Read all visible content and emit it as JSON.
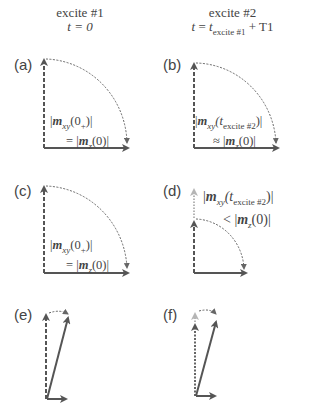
{
  "columns": [
    {
      "title": "excite #1",
      "subtitle_prefix": "t = 0"
    },
    {
      "title": "excite #2",
      "subtitle_t": "t",
      "subtitle_eq": " = ",
      "subtitle_tsub": "t",
      "subtitle_sub": "excite #1",
      "subtitle_suffix": " + T1"
    }
  ],
  "panels": [
    {
      "label": "(a)",
      "line1_open": "|",
      "line1_m": "m",
      "line1_sub": "xy",
      "line1_arg": "(0",
      "line1_argsub": "+",
      "line1_close": ")|",
      "line2_rel": "= |",
      "line2_m": "m",
      "line2_sub": "z",
      "line2_close": "(0)|"
    },
    {
      "label": "(b)",
      "line1_open": "|",
      "line1_m": "m",
      "line1_sub": "xy",
      "line1_arg": "(t",
      "line1_argsub": "excite #2",
      "line1_close": ")|",
      "line2_rel": "≈ |",
      "line2_m": "m",
      "line2_sub": "z",
      "line2_close": "(0)|"
    },
    {
      "label": "(c)",
      "line1_open": "|",
      "line1_m": "m",
      "line1_sub": "xy",
      "line1_arg": "(0",
      "line1_argsub": "+",
      "line1_close": ")|",
      "line2_rel": "= |",
      "line2_m": "m",
      "line2_sub": "z",
      "line2_close": "(0)|"
    },
    {
      "label": "(d)",
      "line1_open": "|",
      "line1_m": "m",
      "line1_sub": "xy",
      "line1_arg": "(t",
      "line1_argsub": "excite #2",
      "line1_close": ")|",
      "line2_rel": "< |",
      "line2_m": "m",
      "line2_sub": "z",
      "line2_close": "(0)|"
    },
    {
      "label": "(e)"
    },
    {
      "label": "(f)"
    }
  ],
  "colors": {
    "arrow": "#555555",
    "arrow_light": "#b0b0b0",
    "text": "#444444"
  }
}
